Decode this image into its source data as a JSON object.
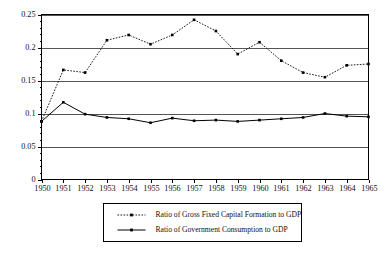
{
  "chart_data": {
    "type": "line",
    "title": "",
    "subtitle": "",
    "xlabel": "",
    "ylabel": "",
    "x": [
      1950,
      1951,
      1952,
      1953,
      1954,
      1955,
      1956,
      1957,
      1958,
      1959,
      1960,
      1961,
      1962,
      1963,
      1964,
      1965
    ],
    "categories": [
      "1950",
      "1951",
      "1952",
      "1953",
      "1954",
      "1955",
      "1956",
      "1957",
      "1958",
      "1959",
      "1960",
      "1961",
      "1962",
      "1963",
      "1964",
      "1965"
    ],
    "xlim": [
      1950,
      1965
    ],
    "ylim": [
      0,
      0.25
    ],
    "y_ticks": [
      0,
      0.05,
      0.1,
      0.15,
      0.2,
      0.25
    ],
    "y_tick_labels": [
      "0",
      "0.05",
      "0.1",
      "0.15",
      "0.2",
      "0.25"
    ],
    "grid": "horizontal",
    "legend_position": "below-center",
    "series": [
      {
        "name": "Ratio of Gross Fixed Capital Formation to GDP",
        "style": "dotted",
        "marker": "square",
        "color": "#000000",
        "values": [
          0.088,
          0.166,
          0.162,
          0.211,
          0.219,
          0.205,
          0.219,
          0.242,
          0.225,
          0.19,
          0.208,
          0.18,
          0.162,
          0.155,
          0.173,
          0.175
        ]
      },
      {
        "name": "Ratio of Government Consumption to GDP",
        "style": "solid",
        "marker": "square",
        "color": "#000000",
        "values": [
          0.088,
          0.117,
          0.099,
          0.094,
          0.092,
          0.086,
          0.093,
          0.089,
          0.09,
          0.088,
          0.09,
          0.092,
          0.094,
          0.1,
          0.096,
          0.095
        ]
      }
    ]
  },
  "legend": {
    "entries": [
      {
        "label": "Ratio of Gross Fixed Capital Formation to GDP"
      },
      {
        "label": "Ratio of Government Consumption to GDP"
      }
    ]
  }
}
